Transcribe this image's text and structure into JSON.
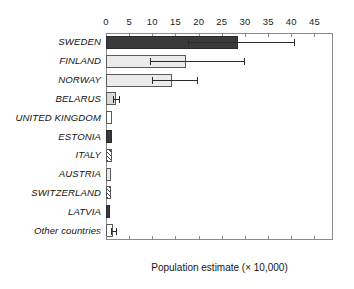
{
  "chart_data": {
    "type": "bar",
    "orientation": "horizontal",
    "title": "",
    "xlabel": "Population estimate (× 10,000)",
    "ylabel": "",
    "xlim": [
      0,
      49
    ],
    "xticks": [
      0,
      5,
      10,
      15,
      20,
      25,
      30,
      35,
      40,
      45
    ],
    "xtick_labels": [
      "0",
      "5",
      "10",
      "15",
      "20",
      "25",
      "30",
      "35",
      "40",
      "45"
    ],
    "axis_top": true,
    "axis_bottom": true,
    "grid": false,
    "legend": "none",
    "categories": [
      "SWEDEN",
      "FINLAND",
      "NORWAY",
      "BELARUS",
      "UNITED KINGDOM",
      "ESTONIA",
      "ITALY",
      "AUSTRIA",
      "SWITZERLAND",
      "LATVIA",
      "Other countries"
    ],
    "values": [
      28.6,
      17.3,
      14.3,
      2.1,
      1.4,
      1.3,
      1.2,
      1.1,
      1.0,
      0.9,
      1.5
    ],
    "error_low": [
      17.7,
      9.5,
      10.0,
      1.6,
      null,
      null,
      null,
      null,
      null,
      null,
      1.1
    ],
    "error_high": [
      40.5,
      29.7,
      19.7,
      2.7,
      null,
      null,
      null,
      null,
      null,
      null,
      2.2
    ],
    "fills": [
      "dark",
      "pale",
      "pale",
      "light",
      "white",
      "dark",
      "hatch",
      "pale",
      "hatch",
      "dark",
      "white"
    ],
    "colors": {
      "dark": "#3a3a3a",
      "light": "#d9d9d9",
      "pale": "#ebebeb",
      "white": "#ffffff",
      "hatch": "#4a4a4a",
      "axis": "#8a8a8a",
      "text": "#141414"
    }
  }
}
